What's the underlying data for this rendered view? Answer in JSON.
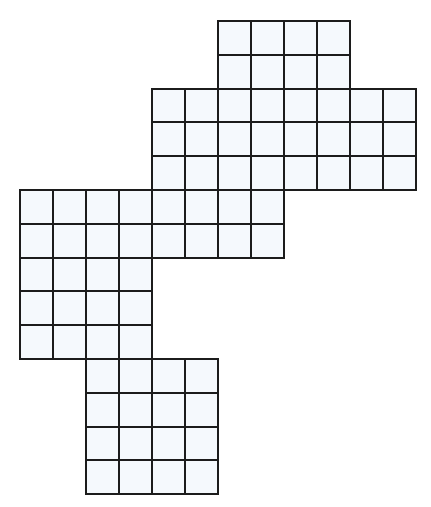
{
  "figure": {
    "type": "polyomino-grid",
    "cell_fill": "#f5f9fd",
    "line_color": "#1c1c1c",
    "origin_x": 20,
    "origin_y": 21,
    "cell_w": 33,
    "cell_h": 33.8,
    "blocks": [
      {
        "name": "top-block",
        "col": 6,
        "row": 0,
        "cols": 4,
        "rows": 2
      },
      {
        "name": "upper-middle-block",
        "col": 4,
        "row": 2,
        "cols": 8,
        "rows": 3
      },
      {
        "name": "middle-left-block",
        "col": 0,
        "row": 5,
        "cols": 8,
        "rows": 2
      },
      {
        "name": "left-column-block",
        "col": 0,
        "row": 7,
        "cols": 4,
        "rows": 3
      },
      {
        "name": "bottom-block",
        "col": 2,
        "row": 10,
        "cols": 4,
        "rows": 4
      }
    ],
    "total_cells": 76
  }
}
